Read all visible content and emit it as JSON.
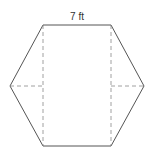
{
  "diagram": {
    "shape": "hexagon",
    "label_top": "7 ft",
    "colors": {
      "stroke": "#555555",
      "dashed": "#888888",
      "text": "#333333"
    }
  }
}
